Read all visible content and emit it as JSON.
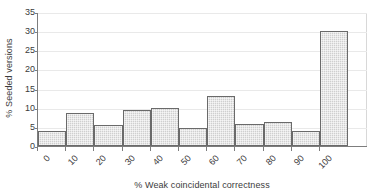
{
  "chart_data": {
    "type": "bar",
    "title": "",
    "subtitle": "",
    "xlabel": "% Weak coincidental correctness",
    "ylabel": "% Seeded versions",
    "categories": [
      "0",
      "10",
      "20",
      "30",
      "40",
      "50",
      "60",
      "70",
      "80",
      "90",
      "100"
    ],
    "values": [
      4,
      8.5,
      5.4,
      9.3,
      10,
      4.7,
      13,
      5.8,
      6.3,
      4,
      30
    ],
    "xtick_labels": [
      "0",
      "10",
      "20",
      "30",
      "40",
      "50",
      "60",
      "70",
      "80",
      "90",
      "100"
    ],
    "ytick_labels": [
      "0",
      "5",
      "10",
      "15",
      "20",
      "25",
      "30",
      "35"
    ],
    "ytick_values": [
      0,
      5,
      10,
      15,
      20,
      25,
      30,
      35
    ],
    "ylim": [
      0,
      35
    ],
    "grid": true,
    "legend": false,
    "legend_position": "none",
    "colors": {
      "bar_fill": "#cfcfcf",
      "bar_border": "#6a6a6a",
      "axis": "#7d7d7d",
      "gridline": "#e9e9e9",
      "text": "#3b3b3b",
      "background": "#ffffff"
    }
  }
}
